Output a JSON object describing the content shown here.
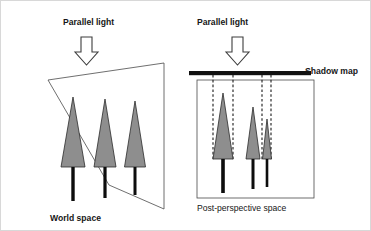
{
  "figure": {
    "background_color": "#ffffff",
    "width": 371,
    "height": 231
  },
  "colors": {
    "canopy_fill": "#8e8e8e",
    "canopy_stroke": "#2b2b2b",
    "trunk": "#0d0d0d",
    "frame_stroke": "#4a4a4a",
    "shadow_map_bar": "#101010",
    "arrow_fill": "#ffffff",
    "arrow_stroke": "#3d3d3d",
    "dashed_line": "#1a1a1a",
    "text": "#161616"
  },
  "left_panel": {
    "name": "world-space-panel",
    "light_label": "Parallel light",
    "caption": "World space",
    "arrow_icon": "down-arrow-icon",
    "arrow_direction": "down",
    "frame_shape": "trapezoid",
    "frame_points": "47,79 163,62 163,208 108,184",
    "tree_count": 3,
    "trees": [
      {
        "name": "tree-1",
        "canopy_apex_x": 72,
        "canopy_apex_y": 96,
        "canopy_base_y": 166,
        "canopy_half_width": 12,
        "trunk_x": 72,
        "trunk_bottom_y": 200,
        "trunk_width": 3.4
      },
      {
        "name": "tree-2",
        "canopy_apex_x": 104,
        "canopy_apex_y": 98,
        "canopy_base_y": 166,
        "canopy_half_width": 11,
        "trunk_x": 104,
        "trunk_bottom_y": 197,
        "trunk_width": 3.2
      },
      {
        "name": "tree-3",
        "canopy_apex_x": 134,
        "canopy_apex_y": 100,
        "canopy_base_y": 166,
        "canopy_half_width": 10.5,
        "trunk_x": 134,
        "trunk_bottom_y": 194,
        "trunk_width": 3.0
      }
    ]
  },
  "right_panel": {
    "name": "post-perspective-space-panel",
    "light_label": "Parallel light",
    "caption": "Post-perspective space",
    "shadow_map_label": "Shadow map",
    "arrow_icon": "down-arrow-icon",
    "arrow_direction": "down",
    "frame_shape": "rectangle",
    "frame_rect": {
      "x": 196,
      "y": 79,
      "width": 117,
      "height": 118
    },
    "shadow_map_bar": {
      "x": 188,
      "y": 70,
      "width": 122,
      "height": 4.2
    },
    "tree_count": 3,
    "trees": [
      {
        "name": "tree-1",
        "canopy_apex_x": 222,
        "canopy_apex_y": 92,
        "canopy_base_y": 158,
        "canopy_half_width": 10,
        "trunk_x": 222,
        "trunk_bottom_y": 192,
        "trunk_width": 3.6
      },
      {
        "name": "tree-2",
        "canopy_apex_x": 252,
        "canopy_apex_y": 106,
        "canopy_base_y": 158,
        "canopy_half_width": 7,
        "trunk_x": 252,
        "trunk_bottom_y": 188,
        "trunk_width": 3.0
      },
      {
        "name": "tree-3",
        "canopy_apex_x": 266,
        "canopy_apex_y": 118,
        "canopy_base_y": 158,
        "canopy_half_width": 4.5,
        "trunk_x": 266,
        "trunk_bottom_y": 186,
        "trunk_width": 2.6
      }
    ],
    "projection_lines": [
      {
        "name": "dashed-line-1",
        "x": 212,
        "y_top": 74,
        "y_bottom": 160
      },
      {
        "name": "dashed-line-2",
        "x": 232,
        "y_top": 74,
        "y_bottom": 160
      },
      {
        "name": "dashed-line-3",
        "x": 261,
        "y_top": 74,
        "y_bottom": 160
      },
      {
        "name": "dashed-line-4",
        "x": 270,
        "y_top": 74,
        "y_bottom": 160
      }
    ]
  }
}
